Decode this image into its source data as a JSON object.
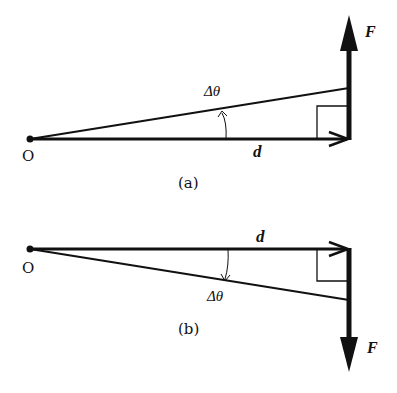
{
  "figure": {
    "panel_a": {
      "caption": "(a)",
      "origin_label": "O",
      "vector_d_label": "d",
      "vector_F_label": "F",
      "angle_label": "Δθ",
      "F_direction": "up",
      "rotation": "counterclockwise"
    },
    "panel_b": {
      "caption": "(b)",
      "origin_label": "O",
      "vector_d_label": "d",
      "vector_F_label": "F",
      "angle_label": "Δθ",
      "F_direction": "down",
      "rotation": "clockwise"
    },
    "colors": {
      "stroke": "#111111",
      "background": "#ffffff"
    }
  }
}
